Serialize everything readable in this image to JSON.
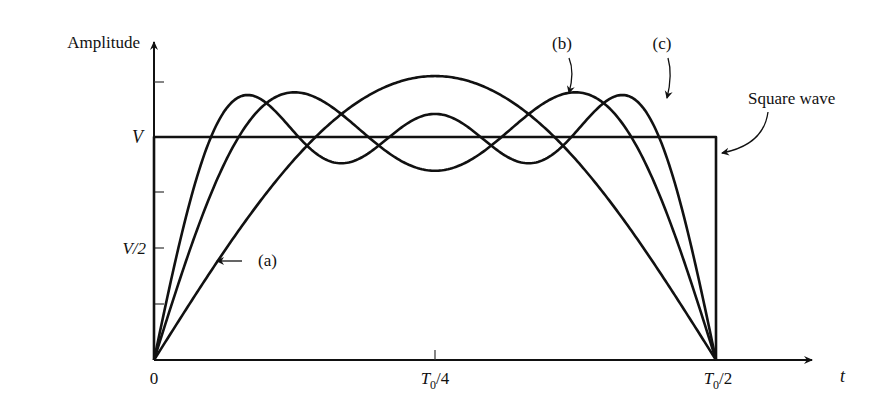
{
  "chart_data": {
    "type": "line",
    "title": "",
    "xlabel": "t",
    "ylabel": "Amplitude",
    "x_ticks": [
      "0",
      "T0/4",
      "T0/2"
    ],
    "y_ticks": [
      "V/2",
      "V"
    ],
    "x_range": [
      0,
      0.5
    ],
    "x_unit": "T0",
    "ylim": [
      0,
      1.35
    ],
    "y_unit": "V",
    "grid": false,
    "series": [
      {
        "name": "Square wave",
        "description": "Square wave of amplitude V over 0 to T0/2",
        "harmonics": []
      },
      {
        "name": "(a)",
        "description": "Fundamental only: (4V/π)·sin(2πt/T0)",
        "harmonics": [
          1
        ]
      },
      {
        "name": "(b)",
        "description": "Sum of 1st and 3rd harmonics",
        "harmonics": [
          1,
          3
        ]
      },
      {
        "name": "(c)",
        "description": "Sum of 1st, 3rd and 5th harmonics",
        "harmonics": [
          1,
          3,
          5
        ]
      }
    ],
    "annotations": [
      "(a)",
      "(b)",
      "(c)",
      "Square wave"
    ]
  },
  "labels": {
    "ylabel": "Amplitude",
    "xlabel": "t",
    "y_V": "V",
    "y_V2": "V/2",
    "x_0": "0",
    "x_T4_main": "T",
    "x_T4_sub": "0",
    "x_T4_rest": "/4",
    "x_T2_main": "T",
    "x_T2_sub": "0",
    "x_T2_rest": "/2",
    "ann_a": "(a)",
    "ann_b": "(b)",
    "ann_c": "(c)",
    "ann_square": "Square wave"
  }
}
